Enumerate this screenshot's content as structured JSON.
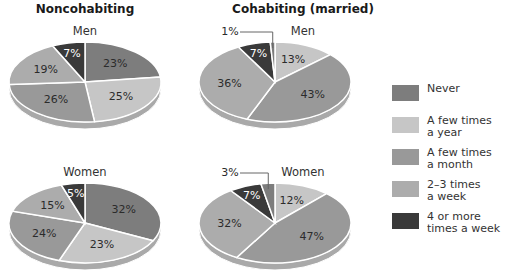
{
  "chart_data": [
    {
      "type": "pie",
      "title": "Noncohabiting",
      "subtitle": "Men",
      "categories": [
        "Never",
        "A few times a year",
        "A few times a month",
        "2–3 times a week",
        "4 or more times a week"
      ],
      "values": [
        23,
        25,
        26,
        19,
        7
      ],
      "labels": [
        "23%",
        "25%",
        "26%",
        "19%",
        "7%"
      ],
      "start_category": "Never"
    },
    {
      "type": "pie",
      "title": "Noncohabiting",
      "subtitle": "Women",
      "categories": [
        "Never",
        "A few times a year",
        "A few times a month",
        "2–3 times a week",
        "4 or more times a week"
      ],
      "values": [
        32,
        23,
        24,
        15,
        5
      ],
      "labels": [
        "32%",
        "23%",
        "24%",
        "15%",
        "5%"
      ],
      "start_category": "Never"
    },
    {
      "type": "pie",
      "title": "Cohabiting (married)",
      "subtitle": "Men",
      "categories": [
        "Never",
        "A few times a year",
        "A few times a month",
        "2–3 times a week",
        "4 or more times a week"
      ],
      "values": [
        1,
        13,
        43,
        36,
        7
      ],
      "labels": [
        "1%",
        "13%",
        "43%",
        "36%",
        "7%"
      ],
      "start_category": "A few times a year"
    },
    {
      "type": "pie",
      "title": "Cohabiting (married)",
      "subtitle": "Women",
      "categories": [
        "Never",
        "A few times a year",
        "A few times a month",
        "2–3 times a week",
        "4 or more times a week"
      ],
      "values": [
        3,
        12,
        47,
        32,
        7
      ],
      "labels": [
        "3%",
        "12%",
        "47%",
        "32%",
        "7%"
      ],
      "start_category": "A few times a year"
    }
  ],
  "columns": {
    "left_title": "Noncohabiting",
    "right_title": "Cohabiting (married)"
  },
  "subtitles": {
    "men": "Men",
    "women": "Women"
  },
  "legend": {
    "position": "right",
    "items": [
      {
        "label": "Never",
        "color": "#7d7d7d"
      },
      {
        "label": "A few times\na year",
        "color": "#c6c6c6"
      },
      {
        "label": "A few times\na month",
        "color": "#999999"
      },
      {
        "label": "2–3 times\na week",
        "color": "#acacac"
      },
      {
        "label": "4 or more\ntimes a week",
        "color": "#3a3a3a"
      }
    ]
  },
  "colors": {
    "Never": "#7d7d7d",
    "A few times a year": "#c6c6c6",
    "A few times a month": "#999999",
    "2–3 times a week": "#acacac",
    "4 or more times a week": "#3a3a3a"
  }
}
